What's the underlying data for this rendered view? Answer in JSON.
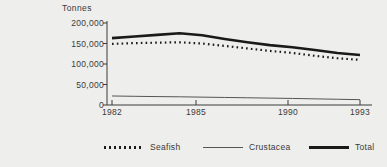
{
  "chart_data": {
    "type": "line",
    "title": "",
    "xlabel": "",
    "ylabel": "Tonnes",
    "ylim": [
      0,
      200000
    ],
    "xlim": [
      1982,
      1993
    ],
    "grid": false,
    "legend_position": "bottom",
    "ytick_labels": [
      "200,000",
      "150,000",
      "100,000",
      "50,000",
      "0"
    ],
    "ytick_values": [
      200000,
      150000,
      100000,
      50000,
      0
    ],
    "xtick_labels": [
      "1982",
      "1985",
      "1990",
      "1993"
    ],
    "xtick_values": [
      1982,
      1985,
      1990,
      1993
    ],
    "x": [
      1982,
      1983,
      1984,
      1985,
      1986,
      1987,
      1988,
      1989,
      1990,
      1991,
      1992,
      1993
    ],
    "series": [
      {
        "name": "Seafish",
        "style": "dotted",
        "color": "#1a1a1a",
        "values": [
          149000,
          151000,
          152000,
          153000,
          150000,
          144000,
          138000,
          132000,
          127000,
          120000,
          114000,
          110000
        ]
      },
      {
        "name": "Crustacea",
        "style": "thin",
        "color": "#555555",
        "values": [
          22000,
          21200,
          20500,
          20000,
          19200,
          18400,
          17600,
          16800,
          16000,
          15000,
          14000,
          13000
        ]
      },
      {
        "name": "Total",
        "style": "thick",
        "color": "#1a1a1a",
        "values": [
          163000,
          167000,
          171000,
          175000,
          170000,
          161000,
          153000,
          146000,
          141000,
          134000,
          127000,
          122000
        ]
      }
    ]
  },
  "legend": {
    "items": [
      {
        "label": "Seafish",
        "style": "dotted"
      },
      {
        "label": "Crustacea",
        "style": "thin"
      },
      {
        "label": "Total",
        "style": "thick"
      }
    ]
  }
}
